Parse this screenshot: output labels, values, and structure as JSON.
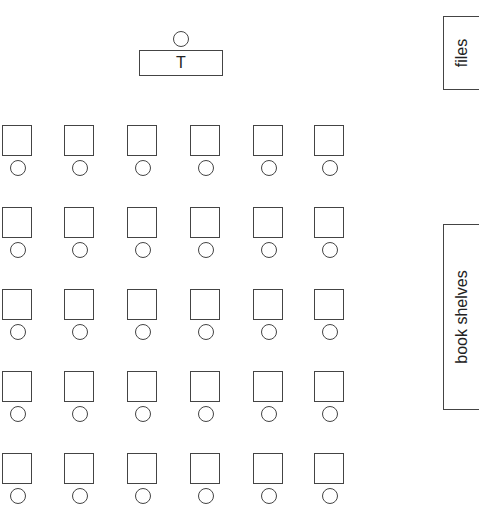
{
  "teacher": {
    "label": "T"
  },
  "furniture": {
    "files": {
      "label": "files"
    },
    "book_shelves": {
      "label": "book shelves"
    }
  },
  "layout": {
    "rows": 5,
    "columns": 6,
    "desk_columns_x": [
      2,
      64,
      127,
      190,
      253,
      314
    ],
    "desk_rows_y": [
      125,
      207,
      289,
      371,
      453
    ]
  },
  "colors": {
    "line": "#444444",
    "background": "#ffffff"
  }
}
